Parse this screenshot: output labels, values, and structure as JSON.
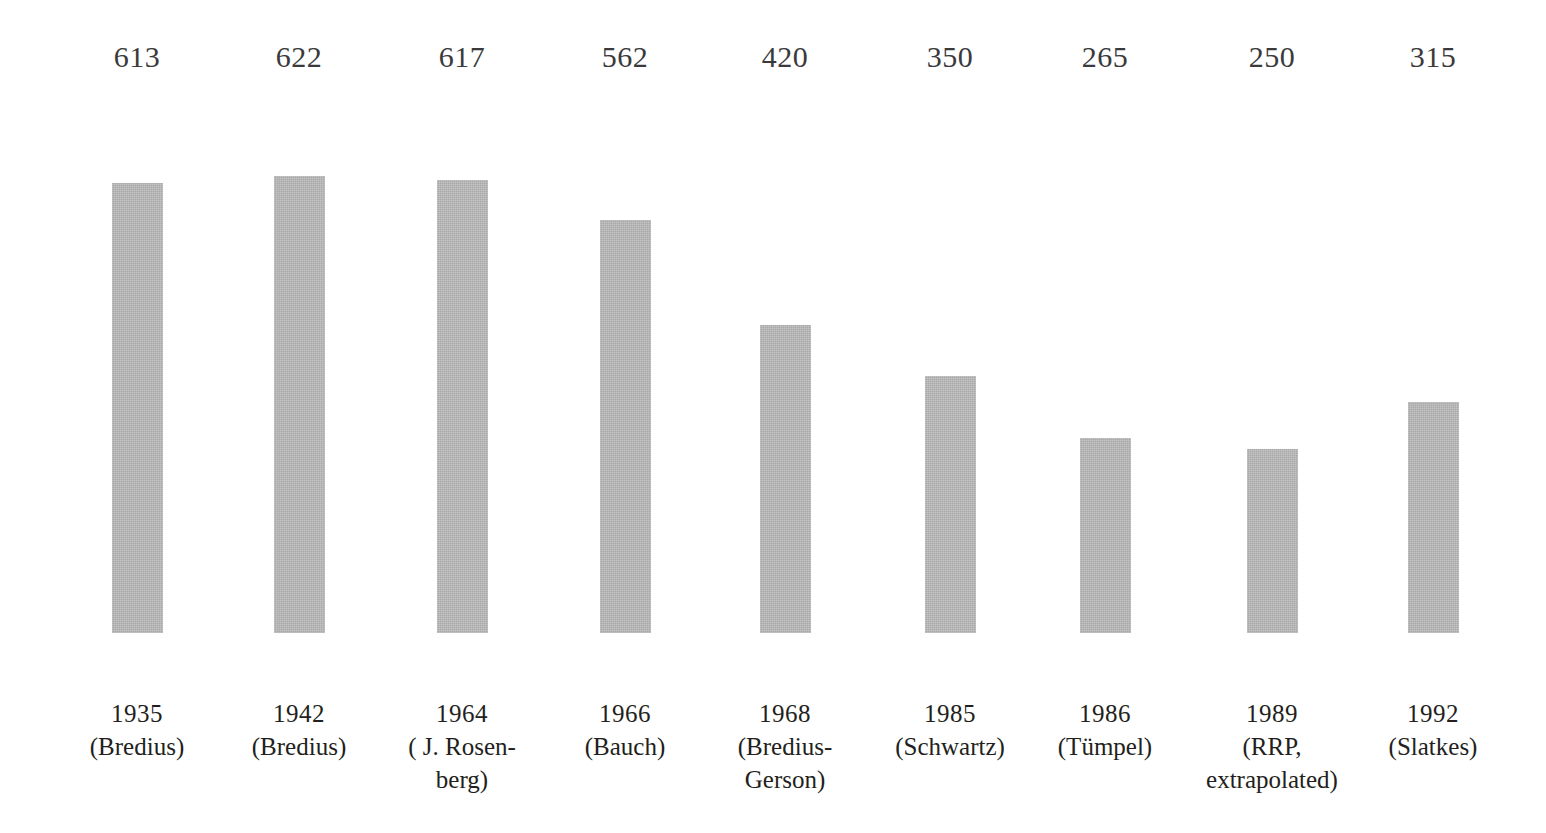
{
  "chart_data": {
    "type": "bar",
    "title": "",
    "subtitle": "",
    "xlabel": "",
    "ylabel": "",
    "grid": false,
    "legend": "none",
    "ylim": [
      0,
      680
    ],
    "categories": [
      "1935 (Bredius)",
      "1942 (Bredius)",
      "1964 (J. Rosenberg)",
      "1966 (Bauch)",
      "1968 (Bredius-Gerson)",
      "1985 (Schwartz)",
      "1986 (Tümpel)",
      "1989 (RRP, extrapolated)",
      "1992 (Slatkes)"
    ],
    "values": [
      613,
      622,
      617,
      562,
      420,
      350,
      265,
      250,
      315
    ],
    "bars": [
      {
        "value_label": "613",
        "value": 613,
        "year": "1935",
        "source": "(Bredius)",
        "center_x": 137,
        "wide": false
      },
      {
        "value_label": "622",
        "value": 622,
        "year": "1942",
        "source": "(Bredius)",
        "center_x": 299,
        "wide": false
      },
      {
        "value_label": "617",
        "value": 617,
        "year": "1964",
        "source": "( J. Rosen-\nberg)",
        "center_x": 462,
        "wide": false
      },
      {
        "value_label": "562",
        "value": 562,
        "year": "1966",
        "source": "(Bauch)",
        "center_x": 625,
        "wide": false
      },
      {
        "value_label": "420",
        "value": 420,
        "year": "1968",
        "source": "(Bredius-\nGerson)",
        "center_x": 785,
        "wide": false
      },
      {
        "value_label": "350",
        "value": 350,
        "year": "1985",
        "source": "(Schwartz)",
        "center_x": 950,
        "wide": false
      },
      {
        "value_label": "265",
        "value": 265,
        "year": "1986",
        "source": "(Tümpel)",
        "center_x": 1105,
        "wide": false
      },
      {
        "value_label": "250",
        "value": 250,
        "year": "1989",
        "source": "(RRP,\nextrapolated)",
        "center_x": 1272,
        "wide": true
      },
      {
        "value_label": "315",
        "value": 315,
        "year": "1992",
        "source": "(Slatkes)",
        "center_x": 1433,
        "wide": false
      }
    ],
    "colors": {
      "bar_fill": "#a9a9a9",
      "background": "#ffffff",
      "value_text": "#3a3a3c",
      "category_text": "#231f20"
    }
  }
}
